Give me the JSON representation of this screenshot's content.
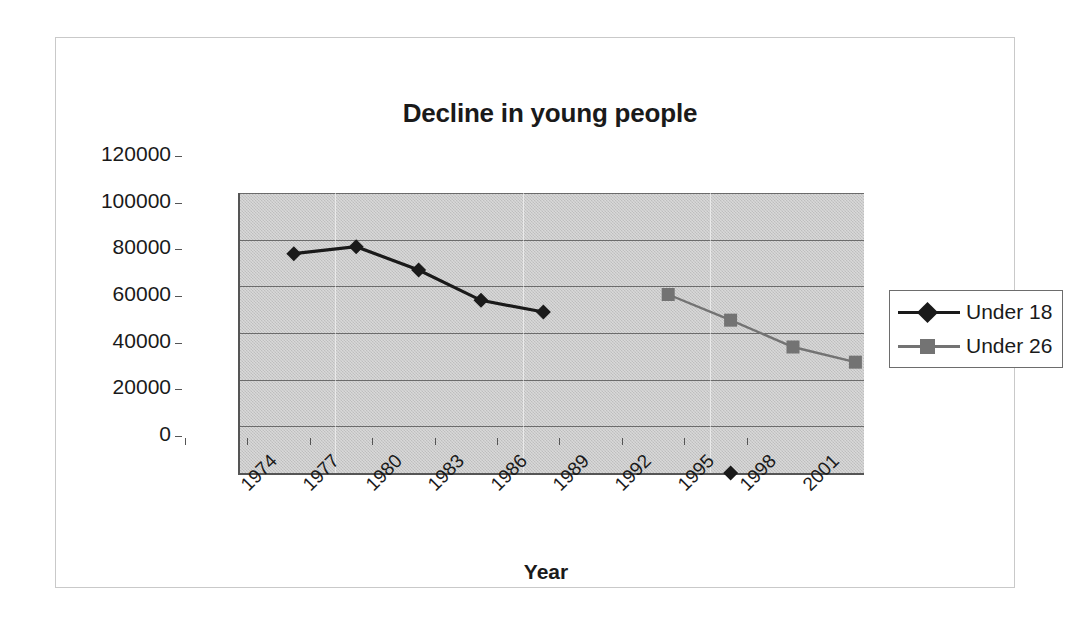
{
  "chart_data": {
    "type": "line",
    "title": "Decline in young people",
    "xlabel": "Year",
    "ylabel": "",
    "categories": [
      "1974",
      "1977",
      "1980",
      "1983",
      "1986",
      "1989",
      "1992",
      "1995",
      "1998",
      "2001"
    ],
    "x_tick_labels": [
      "1974",
      "1977",
      "1980",
      "1983",
      "1986",
      "1989",
      "1992",
      "1995",
      "1998",
      "2001"
    ],
    "y_tick_labels": [
      "0",
      "20000",
      "40000",
      "60000",
      "80000",
      "100000",
      "120000"
    ],
    "ylim": [
      0,
      120000
    ],
    "y_step": 20000,
    "grid": "horizontal",
    "legend_position": "right",
    "series": [
      {
        "name": "Under 18",
        "color": "#1a1a1a",
        "marker": "diamond",
        "points": [
          {
            "year": 1975,
            "value": 94000
          },
          {
            "year": 1978,
            "value": 97000
          },
          {
            "year": 1981,
            "value": 87000
          },
          {
            "year": 1984,
            "value": 74000
          },
          {
            "year": 1987,
            "value": 69000
          },
          {
            "year": 1996,
            "value": 0
          }
        ]
      },
      {
        "name": "Under 26",
        "color": "#737373",
        "marker": "square",
        "points": [
          {
            "year": 1993,
            "value": 76500
          },
          {
            "year": 1996,
            "value": 65500
          },
          {
            "year": 1999,
            "value": 54000
          },
          {
            "year": 2002,
            "value": 47500
          }
        ]
      }
    ]
  },
  "legend": {
    "items": [
      {
        "label": "Under 18",
        "color": "#1a1a1a",
        "marker": "diamond"
      },
      {
        "label": "Under 26",
        "color": "#737373",
        "marker": "square"
      }
    ]
  },
  "colors": {
    "plot_background": "#c9c9c9",
    "axis": "#555555",
    "gridline": "#6b6b6b",
    "series_under18": "#1a1a1a",
    "series_under26": "#737373",
    "text": "#1a1a1a",
    "frame_border": "#c9c9c9"
  }
}
